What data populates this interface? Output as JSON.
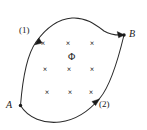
{
  "figure": {
    "stroke_color": "#2b2b2b",
    "text_color": "#1a1a1a",
    "background_color": "#ffffff",
    "width": 147,
    "height": 130
  },
  "points": [
    {
      "id": "A",
      "label": "A",
      "x": 20.5,
      "y": 105.5,
      "label_x": 6,
      "label_y": 100
    },
    {
      "id": "B",
      "label": "B",
      "x": 124.0,
      "y": 35.0,
      "label_x": 129,
      "label_y": 30
    }
  ],
  "paths": [
    {
      "id": "path1",
      "label": "(1)",
      "label_x": 19,
      "label_y": 26,
      "description": "upper S-shaped curve from A to B",
      "d": "M 20.5 105.5 C 22.5 80 26 56 36 42 C 46 28 58 19 72 18 C 86 17 96 25 104 31 C 112 36 118 35 124 35",
      "arrow_at": {
        "x": 38.5,
        "y": 39.0,
        "angle": -57
      }
    },
    {
      "id": "path2",
      "label": "(2)",
      "label_x": 99,
      "label_y": 100,
      "description": "lower curve from A sweeping down and right up to B",
      "d": "M 20.5 105.5 C 28 118 44 124 60 122 C 76 120 90 110 100 98 C 110 86 118 60 124 35",
      "arrow_at": {
        "x": 96.5,
        "y": 102.5,
        "angle": -44
      }
    }
  ],
  "arrowheads": [
    {
      "id": "arrow-path1",
      "on": "path1"
    },
    {
      "id": "arrow-path2",
      "on": "path2"
    },
    {
      "id": "arrow-at-b",
      "on": "path1-end"
    }
  ],
  "field_markers": {
    "symbol": "×",
    "meaning": "magnetic field into the page",
    "rows": 3,
    "cols": 3,
    "positions": [
      {
        "x": 43,
        "y": 44
      },
      {
        "x": 68,
        "y": 44
      },
      {
        "x": 92,
        "y": 44
      },
      {
        "x": 45,
        "y": 70
      },
      {
        "x": 69,
        "y": 70
      },
      {
        "x": 92,
        "y": 70
      },
      {
        "x": 47,
        "y": 93
      },
      {
        "x": 70,
        "y": 93
      },
      {
        "x": 91,
        "y": 93
      }
    ]
  },
  "flux": {
    "symbol": "Φ",
    "label": "Φ",
    "x": 71,
    "y": 57
  }
}
